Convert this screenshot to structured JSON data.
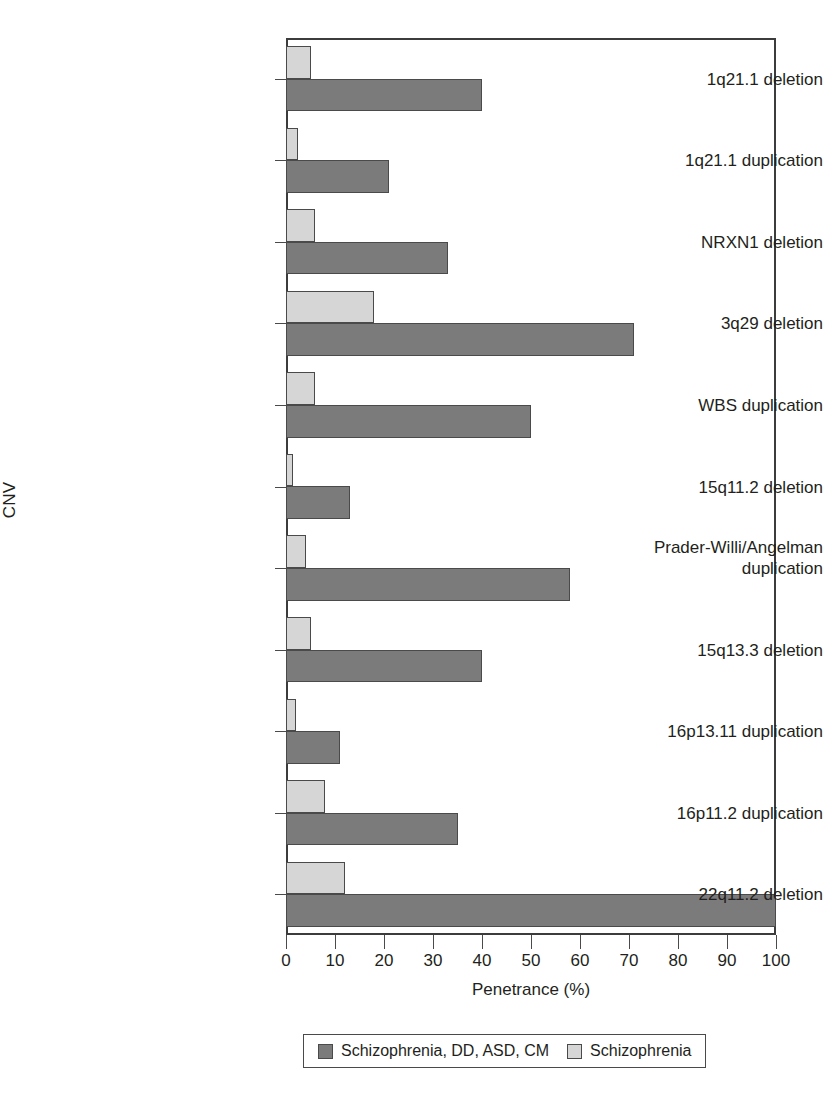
{
  "chart_data": {
    "type": "bar",
    "orientation": "horizontal",
    "title": "",
    "xlabel": "Penetrance (%)",
    "ylabel": "CNV",
    "xlim": [
      0,
      100
    ],
    "xticks": [
      0,
      10,
      20,
      30,
      40,
      50,
      60,
      70,
      80,
      90,
      100
    ],
    "grid": false,
    "legend_position": "bottom",
    "categories": [
      "1q21.1 deletion",
      "1q21.1 duplication",
      "NRXN1 deletion",
      "3q29 deletion",
      "WBS duplication",
      "15q11.2 deletion",
      "Prader-Willi/Angelman\nduplication",
      "15q13.3 deletion",
      "16p13.11 duplication",
      "16p11.2 duplication",
      "22q11.2 deletion"
    ],
    "series": [
      {
        "name": "Schizophrenia, DD, ASD, CM",
        "color": "#7b7b7b",
        "values": [
          40,
          21,
          33,
          71,
          50,
          13,
          58,
          40,
          11,
          35,
          100
        ]
      },
      {
        "name": "Schizophrenia",
        "color": "#d6d6d6",
        "values": [
          5,
          2.5,
          6,
          18,
          6,
          1.5,
          4,
          5,
          2,
          8,
          12
        ]
      }
    ]
  },
  "legend": {
    "entries": [
      {
        "label": "Schizophrenia, DD, ASD, CM",
        "swatch": "dark"
      },
      {
        "label": "Schizophrenia",
        "swatch": "light"
      }
    ]
  },
  "caption": {
    "text": ""
  }
}
